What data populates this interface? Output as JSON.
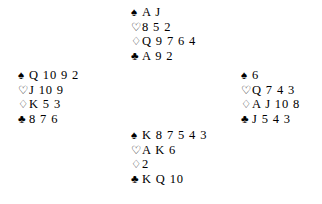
{
  "diagram": {
    "type": "bridge-hand-diagram",
    "background_color": "#ffffff",
    "text_color": "#000000",
    "suits": [
      {
        "key": "spades",
        "symbol": "♠",
        "name": "spade-symbol",
        "style": "filled"
      },
      {
        "key": "hearts",
        "symbol": "♡",
        "name": "heart-symbol",
        "style": "outline"
      },
      {
        "key": "diamonds",
        "symbol": "♢",
        "name": "diamond-symbol",
        "style": "outline"
      },
      {
        "key": "clubs",
        "symbol": "♣",
        "name": "club-symbol",
        "style": "filled"
      }
    ],
    "hands": {
      "north": {
        "position": "North",
        "spades": "A J",
        "hearts": "8 5 2",
        "diamonds": "Q 9 7 6 4",
        "clubs": "A 9 2"
      },
      "west": {
        "position": "West",
        "spades": "Q 10 9 2",
        "hearts": "J 10 9",
        "diamonds": "K 5 3",
        "clubs": "8 7 6"
      },
      "east": {
        "position": "East",
        "spades": "6",
        "hearts": "Q 7 4 3",
        "diamonds": "A J 10 8",
        "clubs": "J 5 4 3"
      },
      "south": {
        "position": "South",
        "spades": "K 8 7 5 4 3",
        "hearts": "A K 6",
        "diamonds": "2",
        "clubs": "K Q 10"
      }
    }
  }
}
